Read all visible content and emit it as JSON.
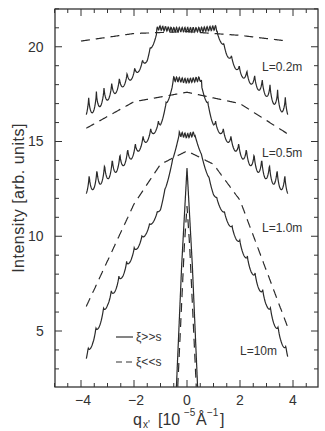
{
  "chart_data": {
    "type": "line",
    "title": "",
    "xlabel": "q_x' [10^-5 Å^-1]",
    "ylabel": "Intensity [arb. units]",
    "xlim": [
      -5.05,
      4.9
    ],
    "ylim": [
      2.05,
      22.0
    ],
    "xticks": [
      -4,
      -2,
      0,
      2,
      4
    ],
    "yticks": [
      5,
      10,
      15,
      20
    ],
    "grid": false,
    "legend": {
      "position": "lower-left",
      "entries": [
        {
          "label": "ξ>>s",
          "style": "solid"
        },
        {
          "label": "ξ<<s",
          "style": "dashed"
        }
      ]
    },
    "annotations": [
      {
        "text": "L=0.2m",
        "x": 3.6,
        "y": 19.9
      },
      {
        "text": "L=0.5m",
        "x": 3.6,
        "y": 15.2
      },
      {
        "text": "L=1.0m",
        "x": 3.6,
        "y": 11.6
      },
      {
        "text": "L=10m",
        "x": 3.4,
        "y": 5.3
      }
    ],
    "series": [
      {
        "name": "L=0.2m ξ>>s",
        "style": "solid",
        "center_x": 0,
        "plateau_halfwidth": 1.1,
        "peak": 21.0,
        "x": [
          -3.8,
          -3.0,
          -2.0,
          -1.5,
          -1.1,
          -0.5,
          0,
          0.5,
          1.1,
          1.5,
          2.0,
          3.0,
          3.8
        ],
        "y": [
          17.3,
          18.0,
          18.9,
          19.6,
          21.0,
          20.9,
          20.9,
          20.9,
          21.0,
          19.9,
          19.0,
          18.2,
          17.3
        ],
        "fringes": true,
        "fringe_amp_edge": 1.0
      },
      {
        "name": "L=0.2m ξ<<s",
        "style": "dashed",
        "x": [
          -4.0,
          -2.0,
          0,
          2.0,
          3.8
        ],
        "y": [
          20.3,
          20.7,
          20.8,
          20.6,
          20.3
        ]
      },
      {
        "name": "L=0.5m ξ>>s",
        "style": "solid",
        "center_x": 0,
        "plateau_halfwidth": 0.5,
        "peak": 18.3,
        "x": [
          -3.8,
          -3.0,
          -2.0,
          -1.0,
          -0.5,
          0,
          0.5,
          1.0,
          2.0,
          3.0,
          3.8
        ],
        "y": [
          13.2,
          14.0,
          14.9,
          16.2,
          18.3,
          18.2,
          18.3,
          16.2,
          14.9,
          14.0,
          13.2
        ],
        "fringes": true
      },
      {
        "name": "L=0.5m ξ<<s",
        "style": "dashed",
        "x": [
          -3.8,
          -2.0,
          0,
          2.0,
          3.8
        ],
        "y": [
          15.7,
          17.1,
          17.6,
          17.0,
          15.4
        ]
      },
      {
        "name": "L=1.0m ξ>>s",
        "style": "solid",
        "center_x": 0,
        "plateau_halfwidth": 0.25,
        "peak": 15.4,
        "x": [
          -3.8,
          -3.0,
          -2.0,
          -1.0,
          -0.3,
          0,
          0.3,
          1.0,
          2.0,
          3.0,
          3.8
        ],
        "y": [
          3.9,
          6.8,
          9.4,
          11.6,
          15.4,
          15.3,
          15.4,
          12.4,
          9.8,
          6.8,
          4.0
        ],
        "fringes": true
      },
      {
        "name": "L=1.0m ξ<<s",
        "style": "dashed",
        "x": [
          -3.8,
          -2.0,
          -1.0,
          0,
          1.0,
          2.0,
          3.8
        ],
        "y": [
          6.3,
          11.7,
          13.8,
          14.5,
          13.8,
          11.9,
          5.2
        ]
      },
      {
        "name": "L=10m ξ>>s",
        "style": "solid",
        "x": [
          -0.4,
          -0.2,
          0,
          0.2,
          0.4
        ],
        "y": [
          2.05,
          8.5,
          13.6,
          8.5,
          2.05
        ]
      },
      {
        "name": "L=10m ξ<<s",
        "style": "dashed",
        "x": [
          -0.35,
          -0.1,
          0,
          0.1,
          0.35
        ],
        "y": [
          2.05,
          9.5,
          11.6,
          9.5,
          2.05
        ]
      }
    ]
  },
  "labels": {
    "ylabel": "Intensity  [arb. units]",
    "xlabel_main": "q",
    "xlabel_sub": "x'",
    "xlabel_units_pre": "[10",
    "xlabel_units_exp": "−5",
    "xlabel_units_mid": "Å",
    "xlabel_units_exp2": "−1",
    "xlabel_units_post": "]",
    "legend_solid": "ξ>>s",
    "legend_dashed": "ξ<<s",
    "tick_x": [
      "−4",
      "−2",
      "0",
      "2",
      "4"
    ],
    "tick_y": [
      "5",
      "10",
      "15",
      "20"
    ]
  }
}
